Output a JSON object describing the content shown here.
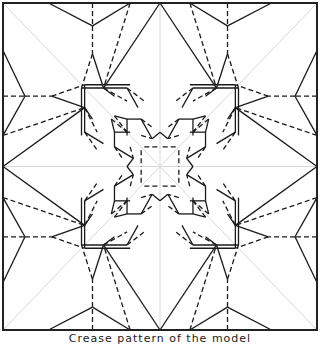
{
  "figure": {
    "type": "origami-crease-pattern",
    "caption": "Crease pattern of the model",
    "symmetry": "8-fold (dihedral, square)",
    "colors": {
      "background": "#ffffff",
      "mountain": "#1a1a1a",
      "valley": "#1a1a1a",
      "reference": "#d8d8d8",
      "border": "#222222"
    },
    "legend": {
      "solid": "mountain fold",
      "dashed": "valley fold",
      "light": "reference line"
    },
    "square": {
      "x0": 3,
      "y0": 3,
      "x1": 317,
      "y1": 330
    },
    "octant_lines_normalized": [
      {
        "t": "m",
        "p": [
          [
            -0.71,
            -1.0
          ],
          [
            -0.43,
            -0.86
          ]
        ]
      },
      {
        "t": "m",
        "p": [
          [
            -0.43,
            -0.86
          ],
          [
            -0.19,
            -1.0
          ]
        ]
      },
      {
        "t": "v",
        "p": [
          [
            -0.43,
            -1.0
          ],
          [
            -0.43,
            -0.86
          ]
        ]
      },
      {
        "t": "v",
        "p": [
          [
            -0.43,
            -0.86
          ],
          [
            -0.43,
            -0.69
          ]
        ]
      },
      {
        "t": "v",
        "p": [
          [
            -0.19,
            -1.0
          ],
          [
            -0.36,
            -0.48
          ]
        ]
      },
      {
        "t": "m",
        "p": [
          [
            -0.43,
            -0.69
          ],
          [
            -0.36,
            -0.48
          ]
        ]
      },
      {
        "t": "m",
        "p": [
          [
            0.0,
            -1.0
          ],
          [
            -0.36,
            -0.48
          ]
        ]
      },
      {
        "t": "m",
        "p": [
          [
            -0.36,
            -0.48
          ],
          [
            -0.29,
            -0.43
          ]
        ]
      },
      {
        "t": "v",
        "p": [
          [
            -0.43,
            -0.69
          ],
          [
            -0.5,
            -0.48
          ]
        ]
      },
      {
        "t": "m",
        "p": [
          [
            -0.5,
            -0.48
          ],
          [
            -0.21,
            -0.48
          ]
        ]
      },
      {
        "t": "m",
        "p": [
          [
            -0.5,
            -0.48
          ],
          [
            -0.5,
            -0.19
          ]
        ]
      },
      {
        "t": "v",
        "p": [
          [
            -0.36,
            -0.48
          ],
          [
            -0.21,
            -0.4
          ]
        ]
      },
      {
        "t": "m",
        "p": [
          [
            -0.21,
            -0.48
          ],
          [
            -0.14,
            -0.36
          ]
        ]
      },
      {
        "t": "v",
        "p": [
          [
            -0.21,
            -0.48
          ],
          [
            -0.1,
            -0.4
          ]
        ]
      },
      {
        "t": "m",
        "p": [
          [
            -0.21,
            -0.29
          ],
          [
            -0.12,
            -0.29
          ]
        ]
      },
      {
        "t": "m",
        "p": [
          [
            -0.21,
            -0.29
          ],
          [
            -0.21,
            -0.19
          ]
        ]
      },
      {
        "t": "v",
        "p": [
          [
            -0.12,
            -0.29
          ],
          [
            -0.05,
            -0.24
          ]
        ]
      },
      {
        "t": "m",
        "p": [
          [
            -0.29,
            -0.31
          ],
          [
            -0.21,
            -0.29
          ]
        ]
      },
      {
        "t": "v",
        "p": [
          [
            -0.29,
            -0.31
          ],
          [
            -0.21,
            -0.21
          ]
        ]
      },
      {
        "t": "v",
        "p": [
          [
            -0.1,
            -0.12
          ],
          [
            0.0,
            -0.12
          ]
        ]
      },
      {
        "t": "m",
        "p": [
          [
            -0.12,
            -0.29
          ],
          [
            -0.05,
            -0.17
          ]
        ]
      },
      {
        "t": "m",
        "p": [
          [
            -0.05,
            -0.17
          ],
          [
            0.0,
            -0.21
          ]
        ]
      },
      {
        "t": "v",
        "p": [
          [
            -0.12,
            -0.19
          ],
          [
            -0.05,
            -0.17
          ]
        ]
      }
    ]
  }
}
